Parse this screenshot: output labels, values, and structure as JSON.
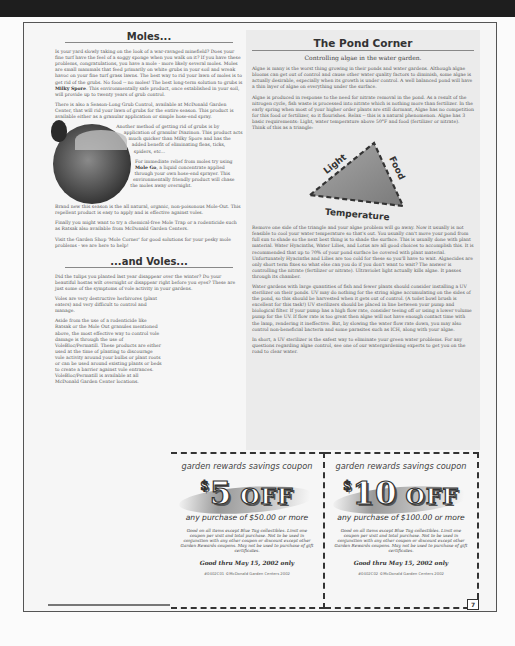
{
  "moles": {
    "title": "Moles...",
    "p1": "Is your yard slowly taking on the look of a war-ravaged minefield? Does your fine turf have the feel of a soggy sponge when you walk on it? If you have these problems, congratulations, you have a mole - more likely several moles. Moles are small mammals that feed primarily on white grubs in your soil and wreak havoc on your fine turf grass lawns. The best way to rid your lawn of moles is to get rid of the grubs. No food -- no moles! The best long-term solution to grubs is ",
    "p1_bold": "Milky Spore",
    "p1_end": ". This environmentally safe product, once established in your soil, will provide up to twenty years of grub control.",
    "p2": "There is also a Season-Long Grub Control, available at McDonald Garden Center, that will rid your lawn of grubs for the entire season. This product is available either as a granular application or simple hose-end spray.",
    "p3": "Another method of getting rid of grubs is by application of granular Diazinon. This product acts much quicker than Milky Spore and has the added benefit of eliminating fleas, ticks, spiders, etc...",
    "p4_start": "For immediate relief from moles try using ",
    "p4_bold": "Mole Go",
    "p4_end": ", a liquid concentrate applied through your own hose-end sprayer. This environmentally friendly product will chase the moles away overnight.",
    "p5": "Brand new this season is the all natural, organic, non-poisonous Mole-Out. This repellent product is easy to apply and is effective against voles.",
    "p6": "Finally you might want to try a chemical-free Mole Trap or a rodenticide such as Ratsak also available from McDonald Garden Centers.",
    "p7": "Visit the Garden Shop 'Mole Corner' for good solutions for your pesky mole problems - we are here to help!"
  },
  "voles": {
    "title": "...and Voles...",
    "p1": "Did the tulips you planted last year disappear over the winter? Do your beautiful hostas wilt overnight or disappear right before you eyes? These are just some of the symptoms of vole activity in your gardens.",
    "p2": "Voles are very destructive herbivores (plant eaters) and very difficult to control and manage.",
    "p3": "Aside from the use of a rodenticide like Ratsak or the Mole Out granules mentioned above, the most effective way to control vole damage is through the use of VoleBloc/Permatill. These products are either used at the time of planting to discourage vole activity around your bulbs or plant roots or can be used around existing plants or beds to create a barrier against vole entrances. VoleBloc/Permatill is available at all McDonald Garden Center locations."
  },
  "pond": {
    "title": "The Pond Corner",
    "subtitle": "Controlling algae in the water garden.",
    "p1": "Algae is many is the worst thing growing in their ponds and water gardens. Although algae blooms can get out of control and cause other water quality factors to diminish, some algae is actually desirable, especially when its growth is under control. A well balanced pond will have a thin layer of algae on everything under the surface.",
    "p2": "Algae is produced in response to the need for nitrate removal in the pond. As a result of the nitrogen cycle, fish waste is processed into nitrate which is nothing more than fertilizer. In the early spring when most of your higher order plants are still dormant, Algae has no competition for this food or fertilizer, so it flourishes. Relax -- this is a natural phenomenon. Algae has 3 basic requirements: Light, water temperature above 50°F and food (fertilizer or nitrate). Think of this as a triangle:",
    "triangle": {
      "side_left": "Light",
      "side_right": "Food",
      "side_bottom": "Temperature"
    },
    "p3": "Remove one side of the triangle and your algae problem will go away. Now it usually is not feasible to cool your water temperature so that's out. You usually can't move your pond from full sun to shade so the next best thing is to shade the surface. This is usually done with plant material. Water Hyacinths, Water Lilies, and Lotus are all good choices to accomplish this. It is recommended that up to 70% of your pond surface be covered with plant material. Unfortunately Hyacinths and Lilies are too cold for these so you'll have to wait. Algaecides are only short term fixes so what else can you do if you don't want to wait? The answer is controlling the nitrate (fertilizer or nitrate). Ultraviolet light actually kills algae. It passes through its chamber.",
    "p4": "Water gardens with large quantities of fish and fewer plants should consider installing a UV sterilizer on their ponds. UV may do nothing for the string algae accumulating on the sides of the pond, so this should be harvested when it gets out of control. (A toilet bowl brush is excellent for this task!) UV sterilizers should be placed in line between your pump and biological filter. If your pump has a high flow rate, consider teeing off or using a lower volume pump for the UV. If flow rate is too great then algae will not have enough contact time with the lamp, rendering it ineffective. But, by slowing the water flow rate down, you may also control non-beneficial bacteria and some parasites such as ICH, along with your algae.",
    "p5": "In short, a UV sterilizer is the safest way to eliminate your green water problems. For any questions regarding algae control, see one of our watergardening experts to get you on the road to clear water."
  },
  "coupons": [
    {
      "header": "garden rewards savings coupon",
      "dollar": "$",
      "amount": "5",
      "off": "OFF",
      "minimum": "any purchase of $50.00 or more",
      "fine_print": "Good on all items except Blue Tag collectibles. Limit one coupon per visit and total purchase. Not to be used in conjunction with any other coupon or discount except other Garden Rewards coupons. May not be used to purchase of gift certificates.",
      "valid": "Good thru May 15, 2002 only",
      "code": "#0402C01 ©McDonald Garden Centers 2002"
    },
    {
      "header": "garden rewards savings coupon",
      "dollar": "$",
      "amount": "10",
      "off": "OFF",
      "minimum": "any purchase of $100.00 or more",
      "fine_print": "Good on all items except Blue Tag collectibles. Limit one coupon per visit and total purchase. Not to be used in conjunction with any other coupon or discount except other Garden Rewards coupons. May not be used to purchase of gift certificates.",
      "valid": "Good thru May 15, 2002 only",
      "code": "#0402C02 ©McDonald Garden Centers 2002"
    }
  ],
  "page_number": "7"
}
